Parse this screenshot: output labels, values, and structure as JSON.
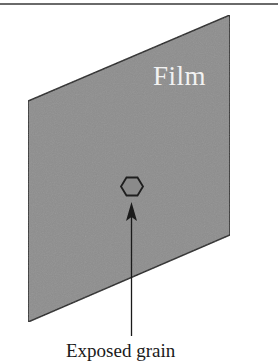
{
  "figure": {
    "film_label": "Film",
    "grain_label": "Exposed grain",
    "colors": {
      "film_fill": "#8e8e8e",
      "film_stroke": "#222222",
      "grain_fill": "#8a8a8a",
      "grain_stroke": "#1e1e1e",
      "arrow": "#1a1a1a",
      "film_text": "#f2f2f2",
      "label_text": "#1a1a1a",
      "rule": "#6a6a6a"
    }
  }
}
